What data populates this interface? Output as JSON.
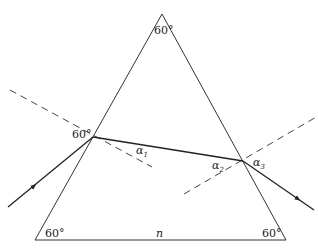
{
  "diagram": {
    "labels": {
      "apex_angle": "60°",
      "left_vertex_angle": "60°",
      "right_vertex_angle": "60°",
      "entry_angle": "60°",
      "alpha1": "α",
      "alpha1_sub": "1",
      "alpha2": "α",
      "alpha2_sub": "2",
      "alpha3": "α",
      "alpha3_sub": "3",
      "index": "n"
    },
    "colors": {
      "line": "#333333",
      "ray": "#222222",
      "dash": "#444444"
    }
  }
}
